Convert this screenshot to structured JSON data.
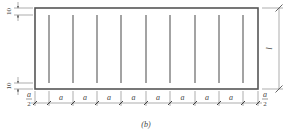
{
  "figure": {
    "caption": "(b)",
    "colors": {
      "stroke": "#555555",
      "rebar": "#666666",
      "text": "#444444",
      "background": "#ffffff"
    },
    "rectangle": {
      "x": 35,
      "y": 8,
      "width": 223,
      "height": 81
    },
    "rebar_lines": {
      "count": 9,
      "x_positions": [
        49,
        73,
        97,
        121,
        146,
        170,
        195,
        219,
        243
      ],
      "y_top": 15,
      "y_bottom": 83
    },
    "left_dimensions": {
      "top_cover": "10",
      "bottom_cover": "10"
    },
    "right_dimension": {
      "label": "l"
    },
    "bottom_dimensions": {
      "segments": [
        {
          "label_num": "a",
          "label_den": "2",
          "type": "half"
        },
        {
          "label": "a",
          "type": "full"
        },
        {
          "label": "a",
          "type": "full"
        },
        {
          "label": "a",
          "type": "full"
        },
        {
          "label": "a",
          "type": "full"
        },
        {
          "label": "a",
          "type": "full"
        },
        {
          "label": "a",
          "type": "full"
        },
        {
          "label": "a",
          "type": "full"
        },
        {
          "label": "a",
          "type": "full"
        },
        {
          "label_num": "a",
          "label_den": "2",
          "type": "half"
        }
      ]
    }
  }
}
